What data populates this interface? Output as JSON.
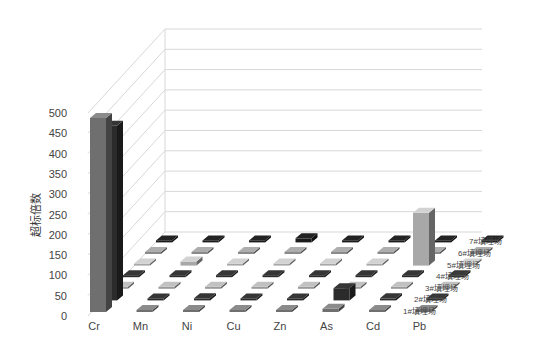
{
  "chart_data": {
    "type": "bar",
    "subtype": "3d-bar",
    "title": "",
    "xlabel": "",
    "ylabel": "超标倍数",
    "ylim": [
      0,
      500
    ],
    "yticks": [
      0,
      50,
      100,
      150,
      200,
      250,
      300,
      350,
      400,
      450,
      500
    ],
    "grid": true,
    "categories": [
      "Cr",
      "Mn",
      "Ni",
      "Cu",
      "Zn",
      "As",
      "Cd",
      "Pb"
    ],
    "series": [
      {
        "name": "1#填埋场",
        "values": [
          478,
          0,
          0,
          0,
          0,
          8,
          0,
          0
        ],
        "color": "#6f6f6f"
      },
      {
        "name": "2#填埋场",
        "values": [
          430,
          0,
          5,
          0,
          0,
          30,
          5,
          0
        ],
        "color": "#2b2b2b"
      },
      {
        "name": "3#填埋场",
        "values": [
          0,
          0,
          0,
          0,
          0,
          0,
          0,
          0
        ],
        "color": "#9a9a9a"
      },
      {
        "name": "4#填埋场",
        "values": [
          0,
          0,
          0,
          0,
          0,
          0,
          0,
          0
        ],
        "color": "#2b2b2b"
      },
      {
        "name": "5#填埋场",
        "values": [
          0,
          10,
          0,
          0,
          0,
          0,
          130,
          0
        ],
        "color": "#a8a8a8"
      },
      {
        "name": "6#填埋场",
        "values": [
          0,
          0,
          0,
          0,
          0,
          0,
          0,
          0
        ],
        "color": "#8a8a8a"
      },
      {
        "name": "7#填埋场",
        "values": [
          0,
          0,
          0,
          10,
          0,
          0,
          0,
          0
        ],
        "color": "#1c1c1c"
      }
    ],
    "depth_labels": [
      "1#填埋场",
      "2#填埋场",
      "3#填埋场",
      "4#填埋场",
      "5#填埋场",
      "6#填埋场",
      "7#填埋场"
    ],
    "legend_position": "depth-axis-right"
  }
}
